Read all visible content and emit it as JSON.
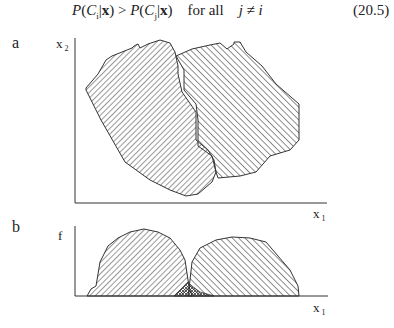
{
  "equation": {
    "lhs": "P(C",
    "sub_i": "i",
    "mid": "|x) > P(C",
    "sub_j": "j",
    "rhs": "|x)",
    "condition": "for all   j ≠ i",
    "number": "(20.5)"
  },
  "panel_a": {
    "label": "a",
    "y_axis": "x",
    "y_axis_sub": "2",
    "x_axis": "x",
    "x_axis_sub": "1"
  },
  "panel_b": {
    "label": "b",
    "y_axis": "f",
    "x_axis": "x",
    "x_axis_sub": "1"
  },
  "figure_description": "Two class regions in feature space (a) and their projected densities along x1 (b), with overlap region cross-hatched"
}
